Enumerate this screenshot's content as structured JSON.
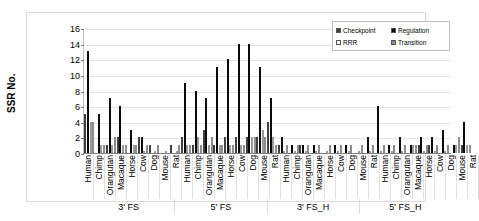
{
  "chart_data": {
    "type": "bar",
    "title": "",
    "xlabel": "",
    "ylabel": "SSR No.",
    "ylim": [
      0,
      16
    ],
    "yticks": [
      0,
      2,
      4,
      6,
      8,
      10,
      12,
      14,
      16
    ],
    "grid": true,
    "legend_position": "top-right",
    "legend": [
      "Checkpoint",
      "Regulation",
      "RRR",
      "Transition"
    ],
    "groups": [
      "3' FS",
      "5' FS",
      "3' FS_H",
      "5' FS_H"
    ],
    "categories": [
      "Human",
      "Chimp",
      "Orangutan",
      "Macaque",
      "Horse",
      "Cow",
      "Dog",
      "Mouse",
      "Rat"
    ],
    "series": [
      {
        "name": "Checkpoint",
        "color": "#404040",
        "values_by_group": {
          "3' FS": [
            5,
            0,
            1,
            2,
            0,
            2,
            1,
            0,
            1
          ],
          "5' FS": [
            2,
            1,
            3,
            1,
            2,
            2,
            2,
            2,
            4
          ],
          "3' FS_H": [
            1,
            0,
            1,
            0,
            0,
            0,
            0,
            0,
            0
          ],
          "5' FS_H": [
            0,
            0,
            0,
            0,
            1,
            1,
            0,
            0,
            1
          ]
        }
      },
      {
        "name": "Regulation",
        "color": "#0a0a0a",
        "values_by_group": {
          "3' FS": [
            13,
            5,
            7,
            6,
            3,
            2,
            0,
            0,
            0
          ],
          "5' FS": [
            9,
            8,
            7,
            11,
            12,
            14,
            14,
            11,
            7
          ],
          "3' FS_H": [
            2,
            1,
            1,
            1,
            0,
            1,
            1,
            0,
            2
          ],
          "5' FS_H": [
            6,
            1,
            2,
            1,
            2,
            2,
            3,
            1,
            4
          ]
        }
      },
      {
        "name": "RRR",
        "color": "#f2f2f2",
        "values_by_group": {
          "3' FS": [
            4,
            1,
            1,
            1,
            1,
            0,
            0,
            0,
            0
          ],
          "5' FS": [
            1,
            2,
            1,
            1,
            1,
            1,
            2,
            3,
            2
          ],
          "3' FS_H": [
            0,
            0,
            0,
            0,
            0,
            0,
            0,
            0,
            0
          ],
          "5' FS_H": [
            0,
            0,
            0,
            1,
            0,
            0,
            0,
            1,
            1
          ]
        }
      },
      {
        "name": "Transition",
        "color": "#8c8c8c",
        "values_by_group": {
          "3' FS": [
            4,
            1,
            2,
            1,
            1,
            1,
            1,
            0,
            1
          ],
          "5' FS": [
            1,
            1,
            2,
            1,
            1,
            1,
            2,
            2,
            1
          ],
          "3' FS_H": [
            1,
            1,
            1,
            1,
            1,
            1,
            1,
            1,
            1
          ],
          "5' FS_H": [
            1,
            1,
            1,
            1,
            1,
            1,
            1,
            2,
            1
          ]
        }
      }
    ]
  }
}
